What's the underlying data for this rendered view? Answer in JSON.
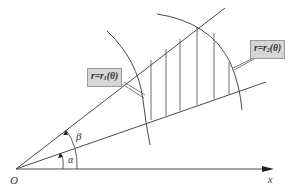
{
  "diagram": {
    "origin_label": "O",
    "x_axis_label": "x",
    "angle_alpha_label": "α",
    "angle_beta_label": "β",
    "curve_inner_label": {
      "prefix": "r=r",
      "sub": "1",
      "suffix": "(θ)"
    },
    "curve_outer_label": {
      "prefix": "r=r",
      "sub": "2",
      "suffix": "(θ)"
    },
    "colors": {
      "line": "#4a4a4a",
      "label_box_fill": "#d6d6d6",
      "label_box_border": "#9a9a9a"
    }
  }
}
